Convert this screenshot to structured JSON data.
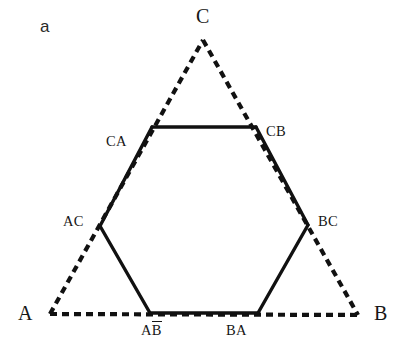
{
  "figure": {
    "panel_letter": "a",
    "background_color": "#ffffff",
    "stroke_color": "#111111",
    "solid_stroke_width": 3.4,
    "dashed_stroke_width": 4.2,
    "dash_pattern": "7 5"
  },
  "triangle": {
    "style": "dashed",
    "vertices": [
      {
        "name": "A",
        "label": "A",
        "x": 50,
        "y": 314,
        "label_x": 18,
        "label_y": 303
      },
      {
        "name": "B",
        "label": "B",
        "x": 358,
        "y": 315,
        "label_x": 374,
        "label_y": 303
      },
      {
        "name": "C",
        "label": "C",
        "x": 203,
        "y": 40,
        "label_x": 196,
        "label_y": 6
      }
    ],
    "edges": [
      {
        "name": "edge-A-C",
        "from": "A",
        "to": "C"
      },
      {
        "name": "edge-C-B",
        "from": "C",
        "to": "B"
      },
      {
        "name": "edge-A-B",
        "from": "A",
        "to": "B"
      }
    ]
  },
  "hexagon": {
    "style": "solid",
    "vertices": [
      {
        "name": "CA",
        "label": "CA",
        "x": 152,
        "y": 127,
        "label_x": 106,
        "label_y": 134
      },
      {
        "name": "CB",
        "label": "CB",
        "x": 256,
        "y": 127,
        "label_x": 266,
        "label_y": 124
      },
      {
        "name": "BC",
        "label": "BC",
        "x": 308,
        "y": 225,
        "label_x": 318,
        "label_y": 214
      },
      {
        "name": "BA",
        "label": "BA",
        "x": 258,
        "y": 313,
        "label_x": 226,
        "label_y": 323
      },
      {
        "name": "AB",
        "label": "AB",
        "label_has_overbar": true,
        "x": 150,
        "y": 313,
        "label_x": 141,
        "label_y": 323
      },
      {
        "name": "AC",
        "label": "AC",
        "x": 100,
        "y": 226,
        "label_x": 63,
        "label_y": 214
      }
    ],
    "edges": [
      {
        "name": "edge-CA-CB",
        "from": "CA",
        "to": "CB"
      },
      {
        "name": "edge-CB-BC",
        "from": "CB",
        "to": "BC"
      },
      {
        "name": "edge-BC-BA",
        "from": "BC",
        "to": "BA"
      },
      {
        "name": "edge-BA-AB",
        "from": "BA",
        "to": "AB"
      },
      {
        "name": "edge-AB-AC",
        "from": "AB",
        "to": "AC"
      },
      {
        "name": "edge-AC-CA",
        "from": "AC",
        "to": "CA"
      }
    ]
  }
}
